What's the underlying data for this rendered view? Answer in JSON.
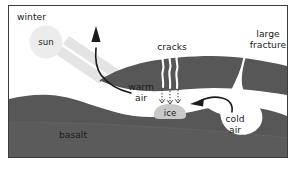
{
  "figure": {
    "type": "cross-section diagram",
    "frame": {
      "border_color": "#3d3d3d",
      "background_color": "#ffffff"
    },
    "colors": {
      "basalt": "#575757",
      "basalt_lower": "#606060",
      "cave_air": "#ffffff",
      "sun": "#ebebeb",
      "sun_ray": "#e2e2e2",
      "ice": "#c9c9c9",
      "crack_line": "#ffffff",
      "arrow": "#1b1b1b",
      "label_text": "#1b1b1b"
    },
    "labels": {
      "season": "winter",
      "sun": "sun",
      "warm_air": "warm\nair",
      "warm_air_line1": "warm",
      "warm_air_line2": "air",
      "cracks": "cracks",
      "large_fracture_line1": "large",
      "large_fracture_line2": "fracture",
      "cold_air_line1": "cold",
      "cold_air_line2": "air",
      "ice": "ice",
      "basalt": "basalt"
    },
    "elements": [
      {
        "name": "sun-circle",
        "kind": "circle",
        "label": "sun"
      },
      {
        "name": "sun-ray-1",
        "kind": "ray"
      },
      {
        "name": "sun-ray-2",
        "kind": "ray"
      },
      {
        "name": "warm-air-arrow",
        "kind": "arrow",
        "direction": "up-left, exits cave upward"
      },
      {
        "name": "cold-air-arrow",
        "kind": "arrow",
        "direction": "right to left into cave"
      },
      {
        "name": "crack-line-1",
        "kind": "wavy-line"
      },
      {
        "name": "crack-line-2",
        "kind": "wavy-line"
      },
      {
        "name": "crack-line-3",
        "kind": "wavy-line"
      },
      {
        "name": "seepage-arrow-1",
        "kind": "dotted-arrow",
        "direction": "down"
      },
      {
        "name": "seepage-arrow-2",
        "kind": "dotted-arrow",
        "direction": "down"
      },
      {
        "name": "seepage-arrow-3",
        "kind": "dotted-arrow",
        "direction": "down"
      },
      {
        "name": "ice-mass",
        "kind": "blob",
        "label": "ice"
      },
      {
        "name": "large-fracture-channel",
        "kind": "channel"
      },
      {
        "name": "basalt-body",
        "kind": "rock-mass",
        "label": "basalt"
      }
    ]
  }
}
